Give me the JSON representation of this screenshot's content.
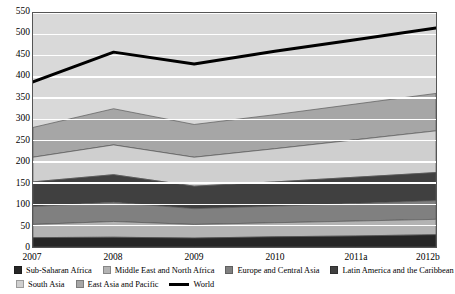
{
  "chart_data": {
    "type": "area",
    "title": "",
    "xlabel": "",
    "ylabel": "",
    "stacked": true,
    "grid": true,
    "grid_color": "#ffffff",
    "plot_background": "#d9d9d9",
    "legend_position": "bottom",
    "x": [
      "2007",
      "2008",
      "2009",
      "2010",
      "2011a",
      "2012b"
    ],
    "ylim": [
      0,
      550
    ],
    "yticks": [
      0,
      50,
      100,
      150,
      200,
      250,
      300,
      350,
      400,
      450,
      500,
      550
    ],
    "categories": [
      "2007",
      "2008",
      "2009",
      "2010",
      "2011a",
      "2012b"
    ],
    "series": [
      {
        "name": "Sub-Saharan Africa",
        "color": "#262626",
        "values": [
          22,
          23,
          21,
          24,
          26,
          29
        ]
      },
      {
        "name": "Middle East and North Africa",
        "color": "#b3b3b3",
        "values": [
          31,
          37,
          32,
          33,
          35,
          36
        ]
      },
      {
        "name": "Europe and Central Asia",
        "color": "#808080",
        "values": [
          42,
          45,
          37,
          39,
          41,
          44
        ]
      },
      {
        "name": "Latin America and the Caribbean",
        "color": "#404040",
        "values": [
          58,
          65,
          53,
          57,
          62,
          66
        ]
      },
      {
        "name": "South Asia",
        "color": "#cfcfcf",
        "values": [
          58,
          70,
          68,
          78,
          88,
          98
        ]
      },
      {
        "name": "East Asia and Pacific",
        "color": "#a6a6a6",
        "values": [
          70,
          85,
          77,
          80,
          84,
          88
        ]
      }
    ],
    "stack_tops": {
      "Sub-Saharan Africa": [
        22,
        23,
        21,
        24,
        26,
        29
      ],
      "Middle East and North Africa": [
        53,
        60,
        53,
        57,
        61,
        65
      ],
      "Europe and Central Asia": [
        95,
        105,
        90,
        96,
        102,
        109
      ],
      "Latin America and the Caribbean": [
        153,
        170,
        143,
        153,
        164,
        175
      ],
      "South Asia": [
        211,
        240,
        211,
        231,
        252,
        273
      ],
      "East Asia and Pacific": [
        281,
        325,
        288,
        311,
        336,
        361
      ]
    },
    "overlay_line": {
      "name": "World",
      "color": "#000000",
      "values": [
        388,
        458,
        430,
        460,
        487,
        515
      ]
    },
    "annotations": []
  },
  "axes": {
    "y_ticks": [
      "550",
      "500",
      "450",
      "400",
      "350",
      "300",
      "250",
      "200",
      "150",
      "100",
      "50",
      "0"
    ],
    "x_ticks": [
      "2007",
      "2008",
      "2009",
      "2010",
      "2011a",
      "2012b"
    ]
  },
  "legend": {
    "row1": [
      {
        "label": "Sub-Saharan Africa",
        "swatch": "#262626",
        "kind": "swatch"
      },
      {
        "label": "Middle East and North Africa",
        "swatch": "#b3b3b3",
        "kind": "swatch"
      },
      {
        "label": "Europe and Central Asia",
        "swatch": "#808080",
        "kind": "swatch"
      },
      {
        "label": "Latin America and the Caribbean",
        "swatch": "#404040",
        "kind": "swatch"
      }
    ],
    "row2": [
      {
        "label": "South Asia",
        "swatch": "#cfcfcf",
        "kind": "swatch"
      },
      {
        "label": "East Asia and Pacific",
        "swatch": "#a6a6a6",
        "kind": "swatch"
      },
      {
        "label": "World",
        "swatch": "#000000",
        "kind": "line"
      }
    ]
  }
}
